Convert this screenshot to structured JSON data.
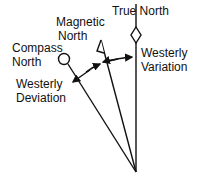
{
  "diagram": {
    "labels": {
      "true_north": "True North",
      "magnetic_north_1": "Magnetic",
      "magnetic_north_2": "North",
      "compass_north_1": "Compass",
      "compass_north_2": "North",
      "westerly_variation_1": "Westerly",
      "westerly_variation_2": "Variation",
      "westerly_deviation_1": "Westerly",
      "westerly_deviation_2": "Deviation"
    },
    "colors": {
      "line": "#111111",
      "background": "#ffffff"
    }
  }
}
